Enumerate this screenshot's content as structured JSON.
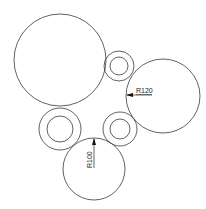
{
  "diagram": {
    "type": "cad-circles",
    "stroke_color": "#3a3a3a",
    "circles": [
      {
        "id": "large-circle",
        "cx": 60,
        "cy": 60,
        "r": 46
      },
      {
        "id": "right-circle",
        "cx": 163,
        "cy": 96,
        "r": 37
      },
      {
        "id": "bottom-circle",
        "cx": 94,
        "cy": 169,
        "r": 31
      }
    ],
    "rings": [
      {
        "id": "top-small-ring",
        "cx": 119,
        "cy": 66,
        "r_outer": 15,
        "r_inner": 9
      },
      {
        "id": "left-ring",
        "cx": 60,
        "cy": 129,
        "r_outer": 21,
        "r_inner": 13
      },
      {
        "id": "middle-ring",
        "cx": 120,
        "cy": 129,
        "r_outer": 17,
        "r_inner": 10
      }
    ],
    "dimensions": [
      {
        "id": "dim-r120",
        "text": "R120"
      },
      {
        "id": "dim-r100",
        "text": "R100"
      }
    ]
  }
}
